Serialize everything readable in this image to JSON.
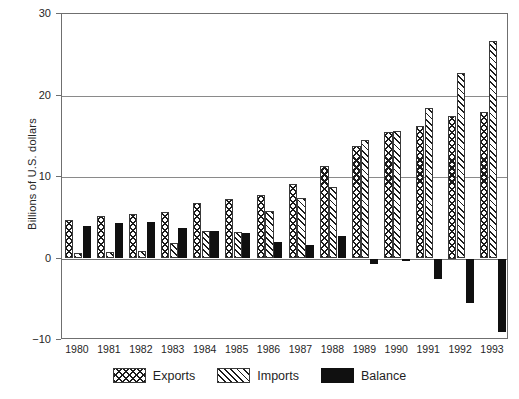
{
  "chart_data": {
    "type": "bar",
    "title": "",
    "subtitle": "",
    "xlabel": "",
    "ylabel": "Billions of U.S. dollars",
    "categories": [
      "1980",
      "1981",
      "1982",
      "1983",
      "1984",
      "1985",
      "1986",
      "1987",
      "1988",
      "1989",
      "1990",
      "1991",
      "1992",
      "1993"
    ],
    "series": [
      {
        "name": "Exports",
        "pattern": "cross-hatch",
        "color": "#ffffff",
        "values": [
          4.7,
          5.2,
          5.4,
          5.7,
          6.8,
          7.3,
          7.8,
          9.2,
          11.4,
          13.8,
          15.5,
          16.2,
          17.5,
          18.0
        ]
      },
      {
        "name": "Imports",
        "pattern": "diagonal-hatch",
        "color": "#ffffff",
        "values": [
          0.7,
          0.8,
          0.9,
          1.9,
          3.4,
          3.2,
          5.8,
          7.4,
          8.8,
          14.5,
          15.7,
          18.5,
          22.8,
          26.7
        ]
      },
      {
        "name": "Balance",
        "pattern": "solid",
        "color": "#101010",
        "values": [
          4.0,
          4.4,
          4.5,
          3.8,
          3.4,
          3.1,
          2.0,
          1.7,
          2.8,
          -0.7,
          -0.3,
          -2.5,
          -5.5,
          -9.0
        ]
      }
    ],
    "ylim": [
      -10,
      30
    ],
    "yticks": [
      -10,
      0,
      10,
      20,
      30
    ],
    "ytick_labels": [
      "−10",
      "0",
      "10",
      "20",
      "30"
    ],
    "grid": true,
    "grid_axis": "y",
    "legend_position": "bottom",
    "legend_entries": [
      "Exports",
      "Imports",
      "Balance"
    ]
  }
}
